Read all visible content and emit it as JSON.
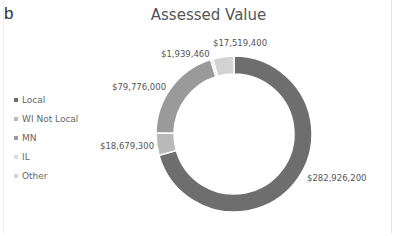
{
  "panel_label": "b",
  "chart_data": {
    "type": "donut",
    "title": "Assessed Value",
    "legend_position": "left",
    "categories": [
      "Local",
      "WI Not Local",
      "MN",
      "IL",
      "Other"
    ],
    "values": [
      282926200,
      18679300,
      79776000,
      1939460,
      17519400
    ],
    "data_labels": [
      "$282,926,200",
      "$18,679,300",
      "$79,776,000",
      "$1,939,460",
      "$17,519,400"
    ],
    "colors": [
      "#6e6e6e",
      "#b9b9b9",
      "#9a9a9a",
      "#dcdcdc",
      "#d3d3d3"
    ]
  },
  "legend": [
    {
      "label": "Local",
      "color": "#6e6e6e"
    },
    {
      "label": "WI Not Local",
      "color": "#b9b9b9"
    },
    {
      "label": "MN",
      "color": "#9a9a9a"
    },
    {
      "label": "IL",
      "color": "#dcdcdc"
    },
    {
      "label": "Other",
      "color": "#d3d3d3"
    }
  ]
}
